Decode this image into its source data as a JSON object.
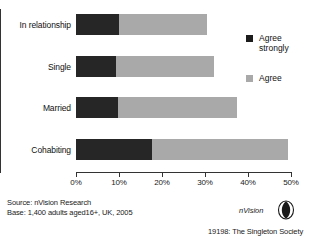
{
  "chart_data": {
    "type": "bar",
    "orientation": "horizontal",
    "stacked": true,
    "title": "",
    "xlabel": "",
    "ylabel": "",
    "xlim": [
      0,
      50
    ],
    "grid": false,
    "legend_position": "right",
    "categories": [
      "In relationship",
      "Single",
      "Married",
      "Cohabiting"
    ],
    "tick_labels": [
      "0%",
      "10%",
      "20%",
      "30%",
      "40%",
      "50%"
    ],
    "tick_values": [
      0,
      10,
      20,
      30,
      40,
      50
    ],
    "series": [
      {
        "name": "Agree strongly",
        "color": "#262626",
        "values": [
          10.0,
          9.3,
          9.8,
          17.7
        ]
      },
      {
        "name": "Agree",
        "color": "#a9a9a9",
        "values": [
          20.5,
          22.7,
          27.7,
          31.6
        ]
      }
    ],
    "totals": [
      30.5,
      32.0,
      37.5,
      49.3
    ]
  },
  "legend": {
    "items": [
      {
        "label": "Agree\nstrongly",
        "swatch": "#1c1c1c"
      },
      {
        "label": "Agree",
        "swatch": "#a9a9a9"
      }
    ]
  },
  "footer": {
    "source_line1": "Source: nVision Research",
    "source_line2": "Base: 1,400 adults aged16+, UK, 2005",
    "brand": "nVision",
    "code": "19198: The Singleton Society"
  }
}
